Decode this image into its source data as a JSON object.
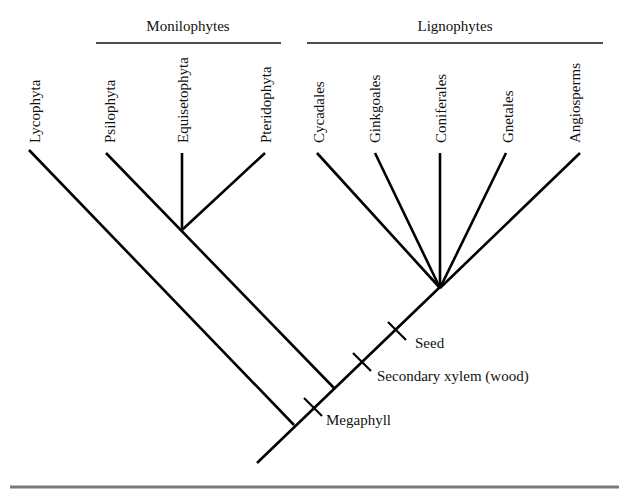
{
  "diagram": {
    "type": "cladogram",
    "clades": [
      {
        "label": "Monilophytes",
        "members": [
          "Psilophyta",
          "Equisetophyta",
          "Pteridophyta"
        ]
      },
      {
        "label": "Lignophytes",
        "members": [
          "Cycadales",
          "Ginkgoales",
          "Coniferales",
          "Gnetales",
          "Angiosperms"
        ]
      }
    ],
    "taxa": [
      {
        "name": "Lycophyta"
      },
      {
        "name": "Psilophyta"
      },
      {
        "name": "Equisetophyta"
      },
      {
        "name": "Pteridophyta"
      },
      {
        "name": "Cycadales"
      },
      {
        "name": "Ginkgoales"
      },
      {
        "name": "Coniferales"
      },
      {
        "name": "Gnetales"
      },
      {
        "name": "Angiosperms"
      }
    ],
    "traits": [
      {
        "label": "Megaphyll"
      },
      {
        "label": "Secondary xylem (wood)"
      },
      {
        "label": "Seed"
      }
    ],
    "colors": {
      "lines": "#000000",
      "text": "#111111",
      "bottom_rule": "#7a7a7a",
      "background": "#ffffff"
    }
  }
}
